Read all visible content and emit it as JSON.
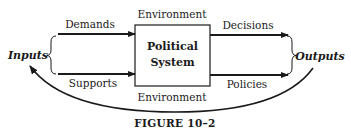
{
  "diagram": {
    "center_box": {
      "line1": "Political",
      "line2": "System"
    },
    "environment_top": "Environment",
    "environment_bottom": "Environment",
    "left_arrows": [
      {
        "label": "Demands"
      },
      {
        "label": "Supports"
      }
    ],
    "right_arrows": [
      {
        "label": "Decisions"
      },
      {
        "label": "Policies"
      }
    ],
    "inputs_label": "Inputs",
    "outputs_label": "Outputs",
    "feedback_arc": "feedback-loop",
    "caption": "FIGURE 10–2"
  }
}
